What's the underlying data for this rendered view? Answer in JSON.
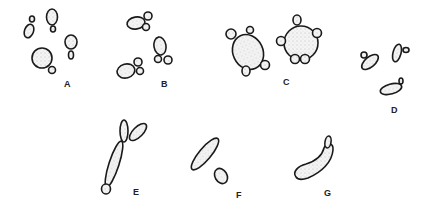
{
  "figure": {
    "panels": [
      {
        "id": "A",
        "label": "A",
        "description": "single budding cells"
      },
      {
        "id": "B",
        "label": "B",
        "description": "oval cells with paired buds"
      },
      {
        "id": "C",
        "label": "C",
        "description": "round cells with multiple buds"
      },
      {
        "id": "D",
        "label": "D",
        "description": "elongated flattened cells with small buds"
      },
      {
        "id": "E",
        "label": "E",
        "description": "elongated pseudohyphal chain"
      },
      {
        "id": "F",
        "label": "F",
        "description": "elongated cell with lateral bud"
      },
      {
        "id": "G",
        "label": "G",
        "description": "curved elongated cell with apical bud"
      }
    ],
    "colors": {
      "ink": "#1a1a1a",
      "background": "#ffffff"
    }
  }
}
